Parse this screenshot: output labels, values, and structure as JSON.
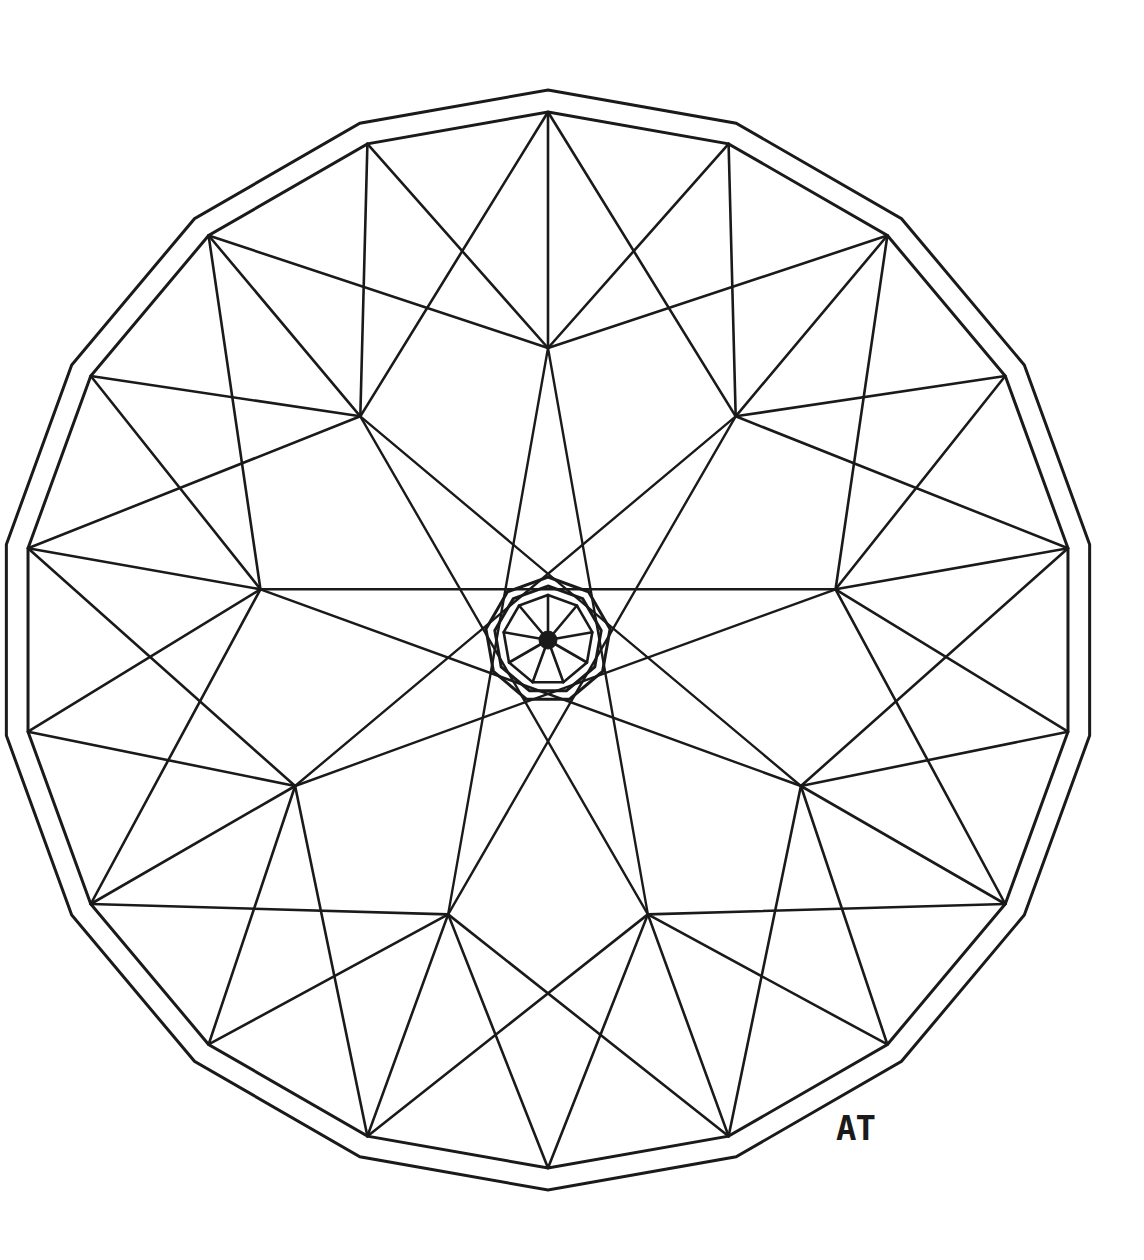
{
  "artwork": {
    "title": "Geometric Mandala Line Drawing",
    "medium": "ink line drawing on white paper",
    "signature": "AT",
    "signature_position": {
      "x": 836,
      "y": 1108
    },
    "background_color": "#ffffff",
    "ink_color": "#1a1a1a",
    "canvas": {
      "width": 1144,
      "height": 1260
    }
  },
  "chart_data": {
    "type": "scatter",
    "xlabel": "",
    "ylabel": "",
    "grid": false,
    "legend": "none",
    "xlim": [
      0,
      1144
    ],
    "ylim": [
      0,
      1260
    ],
    "geometry": {
      "center": {
        "x": 548,
        "y": 640
      },
      "symmetry_order": 9,
      "outer_polygon": {
        "sides": 18,
        "outer_ring_radius": 550,
        "inner_ring_radius": 528,
        "start_angle_deg": -90,
        "stroke_width": 3.0
      },
      "hub_ring": {
        "count": 9,
        "radius": 292,
        "start_angle_deg": -90,
        "fan_span": 5,
        "stroke_width": 2.6,
        "points": [
          {
            "id": "hub-top",
            "x": 548,
            "y": 348
          },
          {
            "id": "hub-upper-right",
            "x": 736,
            "y": 412
          },
          {
            "id": "hub-right",
            "x": 830,
            "y": 588
          },
          {
            "id": "hub-lower-right",
            "x": 795,
            "y": 785
          },
          {
            "id": "hub-bottom-right",
            "x": 653,
            "y": 912
          },
          {
            "id": "hub-bottom-left",
            "x": 443,
            "y": 912
          },
          {
            "id": "hub-left-lower",
            "x": 301,
            "y": 785
          },
          {
            "id": "hub-left",
            "x": 266,
            "y": 588
          },
          {
            "id": "hub-upper-left",
            "x": 360,
            "y": 412
          }
        ]
      },
      "star_chords": {
        "count": 9,
        "step": 4,
        "stroke_width": 2.4,
        "note": "each hub connects to the hub 4 positions away, forming a {9/4} star polygon through the center region"
      },
      "center_rosette": {
        "sides": 9,
        "outer_ring_radius": 63,
        "inner_ring_radius": 54,
        "spoke_polygon_radius": 45,
        "spokes": 9,
        "start_angle_deg": -90,
        "hub_dot_radius": 9,
        "stroke_width": 3.0
      }
    }
  }
}
